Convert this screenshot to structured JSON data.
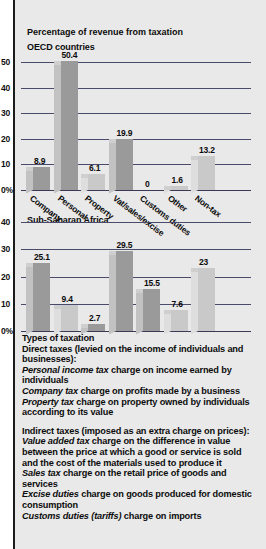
{
  "figure": {
    "suptitle": "Percentage of revenue from taxation",
    "notes_heading": "Types of taxation"
  },
  "chart_data": [
    {
      "type": "bar",
      "title": "OECD countries",
      "categories": [
        "Company",
        "Personal",
        "Property",
        "Vat/sales/excise",
        "Customs duties",
        "Other",
        "Non-tax"
      ],
      "values": [
        8.9,
        50.4,
        6.1,
        19.9,
        0,
        1.6,
        13.2
      ],
      "labels": [
        "8.9",
        "50.4",
        "6.1",
        "19.9",
        "0",
        "1.6",
        "13.2"
      ],
      "xlabel": "",
      "ylabel": "",
      "yticks": [
        "50",
        "40",
        "30",
        "20",
        "10",
        "0%"
      ],
      "ytickvals": [
        50,
        40,
        30,
        20,
        10,
        0
      ],
      "ylim": [
        0,
        55
      ],
      "grid": true,
      "legend": "none"
    },
    {
      "type": "bar",
      "title": "Sub-Saharan Africa",
      "categories": [
        "Company",
        "Personal",
        "Property",
        "Vat/sales/excise",
        "Customs duties",
        "Other",
        "Non-tax"
      ],
      "values": [
        25.1,
        9.4,
        2.7,
        29.5,
        15.5,
        7.6,
        23
      ],
      "labels": [
        "25.1",
        "9.4",
        "2.7",
        "29.5",
        "15.5",
        "7.6",
        "23"
      ],
      "xlabel": "",
      "ylabel": "",
      "yticks": [
        "40",
        "30",
        "20",
        "10",
        "0%"
      ],
      "ytickvals": [
        40,
        30,
        20,
        10,
        0
      ],
      "ylim": [
        0,
        44
      ],
      "grid": true,
      "legend": "none"
    }
  ],
  "notes": {
    "heading": "Types of taxation",
    "direct_heading": "Direct taxes (levied on the income of individuals and businesses):",
    "direct_items": [
      {
        "term": "Personal income  tax",
        "desc": " charge on income earned by individuals"
      },
      {
        "term": "Company tax",
        "desc": "  charge on profits made by a business"
      },
      {
        "term": "Property tax",
        "desc": "  charge on property owned by individuals according to its value"
      }
    ],
    "indirect_heading": "Indirect taxes  (imposed as an extra charge on prices):",
    "indirect_items": [
      {
        "term": "Value added tax",
        "desc": "  charge on the difference in value between the price at which a good or service is sold and the cost of the materials used to produce it"
      },
      {
        "term": "Sales tax",
        "desc": "  charge on the retail price of goods and services"
      },
      {
        "term": "Excise duties",
        "desc": "  charge on goods produced for domestic consumption"
      },
      {
        "term": "Customs duties",
        "desc": "  charge on imports",
        "paren": "(tariffs)"
      }
    ]
  },
  "colors": {
    "panel_bg": "#e9e9e9",
    "bar_front": "#9a9a9a",
    "bar_side": "#c2c2c2",
    "grid": "#4a4a6a",
    "text": "#0c0c0c"
  }
}
